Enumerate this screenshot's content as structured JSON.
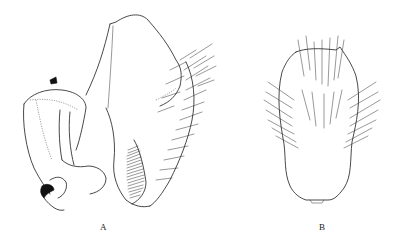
{
  "figure": {
    "corner_text": "",
    "panels": [
      {
        "id": "A",
        "label": "A"
      },
      {
        "id": "B",
        "label": "B"
      }
    ]
  }
}
